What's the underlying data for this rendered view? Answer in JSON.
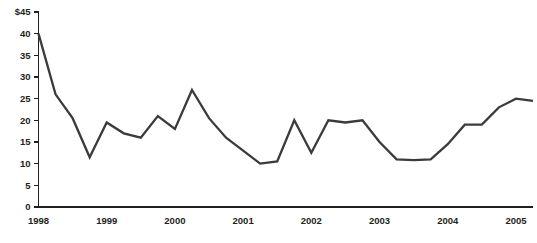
{
  "chart_data": {
    "type": "line",
    "title": "",
    "xlabel": "",
    "ylabel": "",
    "currency_prefix": "$",
    "ylim": [
      0,
      45
    ],
    "ytick_values": [
      0,
      5,
      10,
      15,
      20,
      25,
      30,
      35,
      40,
      45
    ],
    "ytick_labels": [
      "0",
      "5",
      "10",
      "15",
      "20",
      "25",
      "30",
      "35",
      "40",
      "$45"
    ],
    "xtick_labels": [
      "1998",
      "1999",
      "2000",
      "2001",
      "2002",
      "2003",
      "2004",
      "2005"
    ],
    "xtick_values": [
      1998,
      1999,
      2000,
      2001,
      2002,
      2003,
      2004,
      2005
    ],
    "xlim": [
      1998,
      2005.25
    ],
    "grid": false,
    "legend": false,
    "line_color": "#3b3a3c",
    "axis_color": "#231f20",
    "series": [
      {
        "name": "value",
        "x": [
          1998.0,
          1998.25,
          1998.5,
          1998.75,
          1999.0,
          1999.25,
          1999.5,
          1999.75,
          2000.0,
          2000.25,
          2000.5,
          2000.75,
          2001.0,
          2001.25,
          2001.5,
          2001.75,
          2002.0,
          2002.25,
          2002.5,
          2002.75,
          2003.0,
          2003.25,
          2003.5,
          2003.75,
          2004.0,
          2004.25,
          2004.5,
          2004.75,
          2005.0,
          2005.25
        ],
        "values": [
          40.0,
          26.0,
          20.5,
          11.5,
          19.5,
          17.0,
          16.0,
          21.0,
          18.0,
          27.0,
          20.5,
          16.0,
          13.0,
          10.0,
          10.5,
          20.0,
          12.5,
          20.0,
          19.5,
          20.0,
          15.0,
          11.0,
          10.8,
          11.0,
          14.5,
          19.0,
          19.0,
          23.0,
          25.0,
          24.5
        ]
      }
    ]
  }
}
